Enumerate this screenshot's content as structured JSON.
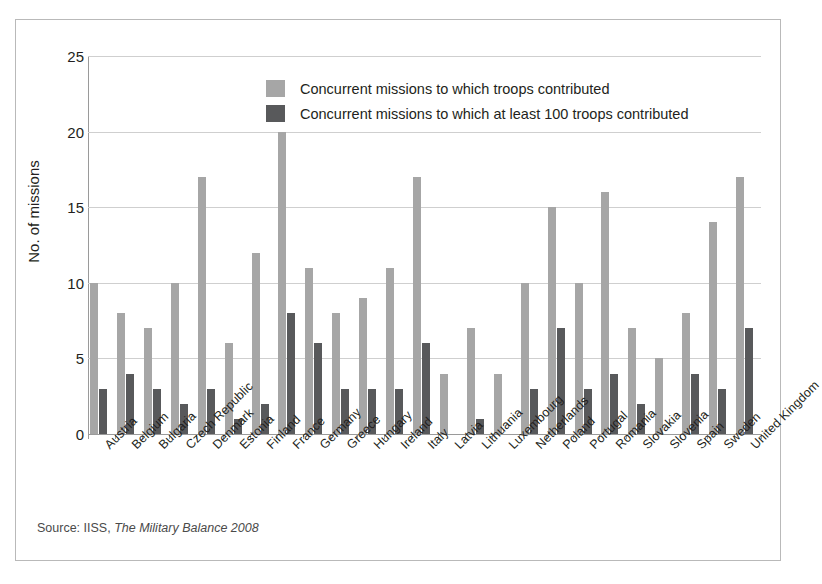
{
  "chart_data": {
    "type": "bar",
    "title": "",
    "xlabel": "",
    "ylabel": "No. of missions",
    "ylim": [
      0,
      25
    ],
    "yticks": [
      0,
      5,
      10,
      15,
      20,
      25
    ],
    "grid": true,
    "legend_position": "top-center",
    "categories": [
      "Austria",
      "Belgium",
      "Bulgaria",
      "Czech Republic",
      "Denmark",
      "Estonia",
      "Finland",
      "France",
      "Germany",
      "Greece",
      "Hungary",
      "Ireland",
      "Italy",
      "Latvia",
      "Lithuania",
      "Luxembourg",
      "Netherlands",
      "Poland",
      "Portugal",
      "Romania",
      "Slovakia",
      "Slovenia",
      "Spain",
      "Sweden",
      "United Kingdom"
    ],
    "series": [
      {
        "name": "Concurrent missions to which troops contributed",
        "color": "#a6a6a6",
        "values": [
          10,
          8,
          7,
          10,
          17,
          6,
          12,
          20,
          11,
          8,
          9,
          11,
          17,
          4,
          7,
          4,
          10,
          15,
          10,
          16,
          7,
          5,
          8,
          14,
          17
        ]
      },
      {
        "name": "Concurrent missions to which at least 100 troops contributed",
        "color": "#58595b",
        "values": [
          3,
          4,
          3,
          2,
          3,
          1,
          2,
          8,
          6,
          3,
          3,
          3,
          6,
          0,
          1,
          0,
          3,
          7,
          3,
          4,
          2,
          0,
          4,
          3,
          7
        ]
      }
    ]
  },
  "legend": {
    "items": [
      {
        "label": "Concurrent missions to which troops contributed",
        "swatch": "light"
      },
      {
        "label": "Concurrent missions to which at least 100 troops contributed",
        "swatch": "dark"
      }
    ]
  },
  "source": {
    "prefix": "Source: IISS, ",
    "italic": "The Military Balance 2008"
  }
}
